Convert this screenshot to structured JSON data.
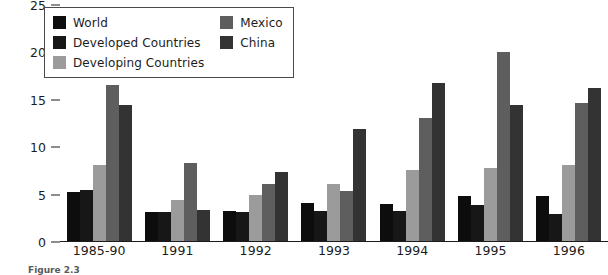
{
  "chart_data": {
    "type": "bar",
    "title": "",
    "xlabel": "",
    "ylabel": "",
    "ylim": [
      0,
      25
    ],
    "yticks": [
      25,
      20,
      15,
      10,
      5,
      0
    ],
    "grid": false,
    "legend_position": "top-left",
    "categories": [
      "1985-90",
      "1991",
      "1992",
      "1993",
      "1994",
      "1995",
      "1996"
    ],
    "series": [
      {
        "name": "World",
        "color": "#0d0d0d",
        "values": [
          5.2,
          3.1,
          3.2,
          4.0,
          3.9,
          4.7,
          4.8
        ]
      },
      {
        "name": "Developed Countries",
        "color": "#171717",
        "values": [
          5.4,
          3.1,
          3.1,
          3.2,
          3.2,
          3.8,
          2.8
        ]
      },
      {
        "name": "Developing Countries",
        "color": "#9b9b9b",
        "values": [
          8.0,
          4.3,
          4.9,
          6.0,
          7.5,
          7.7,
          8.0
        ]
      },
      {
        "name": "Mexico",
        "color": "#5e5e5e",
        "values": [
          16.5,
          8.2,
          6.0,
          5.3,
          13.0,
          19.9,
          14.6
        ]
      },
      {
        "name": "China",
        "color": "#333333",
        "values": [
          14.3,
          3.3,
          7.3,
          11.8,
          16.7,
          14.3,
          16.1
        ]
      }
    ]
  },
  "caption": "Figure 2.3"
}
